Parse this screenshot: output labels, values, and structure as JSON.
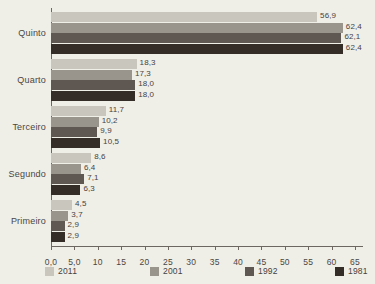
{
  "chart_data": {
    "type": "bar",
    "orientation": "horizontal",
    "title": "",
    "subtitle": "",
    "xlabel": "",
    "ylabel": "",
    "xlim": [
      0,
      65
    ],
    "grid": false,
    "legend_position": "bottom",
    "categories": [
      "Primeiro",
      "Segundo",
      "Terceiro",
      "Quarto",
      "Quinto"
    ],
    "categories_top_to_bottom": [
      "Quinto",
      "Quarto",
      "Terceiro",
      "Segundo",
      "Primeiro"
    ],
    "xticks": [
      "0,0",
      "5,0",
      "10",
      "15",
      "20",
      "25",
      "30",
      "35",
      "40",
      "45",
      "50",
      "55",
      "60",
      "65"
    ],
    "xtick_values": [
      0,
      5,
      10,
      15,
      20,
      25,
      30,
      35,
      40,
      45,
      50,
      55,
      60,
      65
    ],
    "series": [
      {
        "name": "2011",
        "color": "#c9c6bd",
        "values": [
          4.5,
          8.6,
          11.7,
          18.3,
          56.9
        ],
        "labels": [
          "4,5",
          "8,6",
          "11,7",
          "18,3",
          "56,9"
        ]
      },
      {
        "name": "2001",
        "color": "#9a958c",
        "values": [
          3.7,
          6.4,
          10.2,
          17.3,
          62.4
        ],
        "labels": [
          "3,7",
          "6,4",
          "10,2",
          "17,3",
          "62,4"
        ]
      },
      {
        "name": "1992",
        "color": "#5f5852",
        "values": [
          2.9,
          7.1,
          9.9,
          18.0,
          62.1
        ],
        "labels": [
          "2,9",
          "7,1",
          "9,9",
          "18,0",
          "62,1"
        ]
      },
      {
        "name": "1981",
        "color": "#332c27",
        "values": [
          2.9,
          6.3,
          10.5,
          18.0,
          62.4
        ],
        "labels": [
          "2,9",
          "6,3",
          "10,5",
          "18,0",
          "62,4"
        ]
      }
    ]
  },
  "colors": {
    "background": "#efeee7",
    "axis": "#6d6762",
    "text": "#4a4642"
  }
}
